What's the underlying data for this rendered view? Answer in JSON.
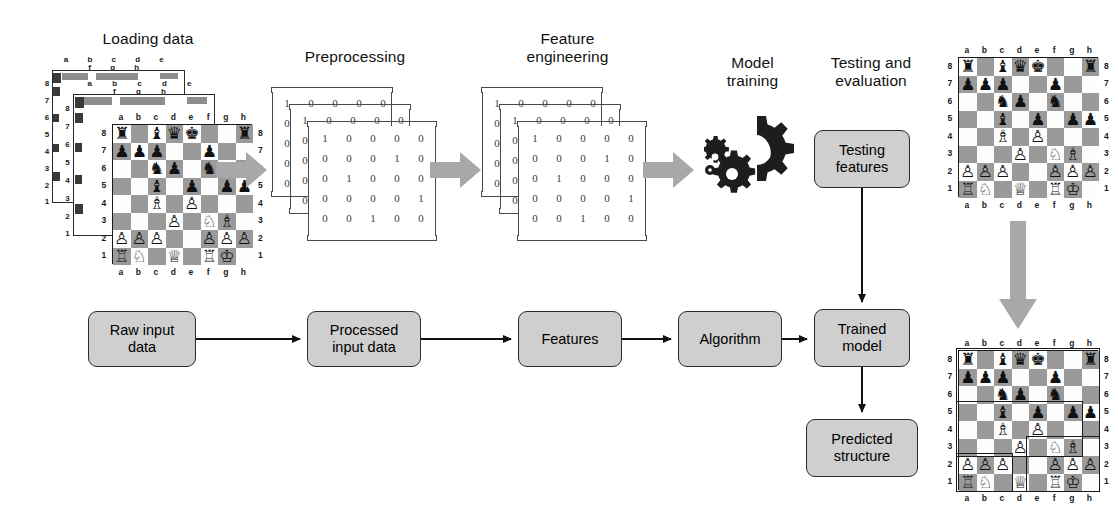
{
  "diagram": {
    "accent_gray": "#cfcfcf",
    "arrow_gray": "#a8a8a8",
    "line_color": "#1a1a1a"
  },
  "stage_labels": [
    {
      "id": "loading-data",
      "text": "Loading data"
    },
    {
      "id": "preprocessing",
      "text": "Preprocessing"
    },
    {
      "id": "feature-engineering",
      "text": "Feature\nengineering"
    },
    {
      "id": "model-training",
      "text": "Model\ntraining"
    },
    {
      "id": "testing-evaluation",
      "text": "Testing and\nevaluation"
    }
  ],
  "boxes": [
    {
      "id": "raw-input-data",
      "label": "Raw input\ndata"
    },
    {
      "id": "processed-input-data",
      "label": "Processed\ninput data"
    },
    {
      "id": "features",
      "label": "Features"
    },
    {
      "id": "algorithm",
      "label": "Algorithm"
    },
    {
      "id": "trained-model",
      "label": "Trained\nmodel"
    },
    {
      "id": "testing-features",
      "label": "Testing\nfeatures"
    },
    {
      "id": "predicted-structure",
      "label": "Predicted\nstructure"
    }
  ],
  "matrices": {
    "preprocessing": {
      "rows": 5,
      "cols": 5,
      "values": [
        [
          1,
          0,
          0,
          0,
          0
        ],
        [
          0,
          0,
          0,
          1,
          0
        ],
        [
          0,
          1,
          0,
          0,
          0
        ],
        [
          0,
          0,
          0,
          0,
          1
        ],
        [
          0,
          0,
          1,
          0,
          0
        ]
      ],
      "stack_behind": [
        {
          "first_col": [
            1,
            0,
            0,
            0,
            0
          ],
          "top_row": [
            1,
            0,
            0,
            0,
            0
          ]
        },
        {
          "first_col": [
            1,
            0,
            0,
            0,
            0
          ],
          "top_row": [
            1,
            0,
            0,
            0,
            0
          ]
        }
      ]
    },
    "feature_engineering": {
      "rows": 5,
      "cols": 5,
      "values": [
        [
          1,
          0,
          0,
          0,
          0
        ],
        [
          0,
          0,
          0,
          1,
          0
        ],
        [
          0,
          1,
          0,
          0,
          0
        ],
        [
          0,
          0,
          0,
          0,
          1
        ],
        [
          0,
          0,
          1,
          0,
          0
        ]
      ],
      "stack_behind": [
        {
          "first_col": [
            1,
            0,
            0,
            0,
            0
          ],
          "top_row": [
            1,
            0,
            0,
            0,
            0
          ]
        },
        {
          "first_col": [
            1,
            0,
            0,
            0,
            0
          ],
          "top_row": [
            1,
            0,
            0,
            0,
            0
          ]
        }
      ]
    }
  },
  "chess": {
    "files": [
      "a",
      "b",
      "c",
      "d",
      "e",
      "f",
      "g",
      "h"
    ],
    "ranks": [
      "8",
      "7",
      "6",
      "5",
      "4",
      "3",
      "2",
      "1"
    ],
    "position_name": "Main board position",
    "pieces": [
      {
        "sq": "a8",
        "piece": "rook",
        "color": "black",
        "glyph": "♜"
      },
      {
        "sq": "c8",
        "piece": "bishop",
        "color": "black",
        "glyph": "♝"
      },
      {
        "sq": "d8",
        "piece": "queen",
        "color": "black",
        "glyph": "♛"
      },
      {
        "sq": "e8",
        "piece": "king",
        "color": "black",
        "glyph": "♚"
      },
      {
        "sq": "h8",
        "piece": "rook",
        "color": "black",
        "glyph": "♜"
      },
      {
        "sq": "a7",
        "piece": "pawn",
        "color": "black",
        "glyph": "♟"
      },
      {
        "sq": "b7",
        "piece": "pawn",
        "color": "black",
        "glyph": "♟"
      },
      {
        "sq": "c7",
        "piece": "pawn",
        "color": "black",
        "glyph": "♟"
      },
      {
        "sq": "f7",
        "piece": "pawn",
        "color": "black",
        "glyph": "♟"
      },
      {
        "sq": "c6",
        "piece": "knight",
        "color": "black",
        "glyph": "♞"
      },
      {
        "sq": "d6",
        "piece": "pawn",
        "color": "black",
        "glyph": "♟"
      },
      {
        "sq": "f6",
        "piece": "knight",
        "color": "black",
        "glyph": "♞"
      },
      {
        "sq": "c5",
        "piece": "bishop",
        "color": "black",
        "glyph": "♝"
      },
      {
        "sq": "e5",
        "piece": "pawn",
        "color": "black",
        "glyph": "♟"
      },
      {
        "sq": "g5",
        "piece": "pawn",
        "color": "black",
        "glyph": "♟"
      },
      {
        "sq": "h5",
        "piece": "pawn",
        "color": "black",
        "glyph": "♟"
      },
      {
        "sq": "c4",
        "piece": "bishop",
        "color": "white",
        "glyph": "♗"
      },
      {
        "sq": "e4",
        "piece": "pawn",
        "color": "white",
        "glyph": "♙"
      },
      {
        "sq": "d3",
        "piece": "pawn",
        "color": "white",
        "glyph": "♙"
      },
      {
        "sq": "f3",
        "piece": "knight",
        "color": "white",
        "glyph": "♘"
      },
      {
        "sq": "g3",
        "piece": "bishop",
        "color": "white",
        "glyph": "♗"
      },
      {
        "sq": "a2",
        "piece": "pawn",
        "color": "white",
        "glyph": "♙"
      },
      {
        "sq": "b2",
        "piece": "pawn",
        "color": "white",
        "glyph": "♙"
      },
      {
        "sq": "c2",
        "piece": "pawn",
        "color": "white",
        "glyph": "♙"
      },
      {
        "sq": "f2",
        "piece": "pawn",
        "color": "white",
        "glyph": "♙"
      },
      {
        "sq": "g2",
        "piece": "pawn",
        "color": "white",
        "glyph": "♙"
      },
      {
        "sq": "h2",
        "piece": "pawn",
        "color": "white",
        "glyph": "♙"
      },
      {
        "sq": "a1",
        "piece": "rook",
        "color": "white",
        "glyph": "♖"
      },
      {
        "sq": "b1",
        "piece": "knight",
        "color": "white",
        "glyph": "♘"
      },
      {
        "sq": "d1",
        "piece": "queen",
        "color": "white",
        "glyph": "♕"
      },
      {
        "sq": "f1",
        "piece": "rook",
        "color": "white",
        "glyph": "♖"
      },
      {
        "sq": "g1",
        "piece": "king",
        "color": "white",
        "glyph": "♔"
      }
    ],
    "predicted_regions": [
      {
        "id": "region-outer",
        "from": "a8",
        "to": "h1"
      },
      {
        "id": "region-queenside",
        "from": "a2",
        "to": "c1"
      },
      {
        "id": "region-kingside",
        "from": "e3",
        "to": "h1"
      },
      {
        "id": "region-center",
        "from": "a5",
        "to": "g3"
      }
    ],
    "stack_count": 3
  },
  "icons": {
    "gears": "gears-icon",
    "block_arrow_right": "block-arrow-right-icon",
    "block_arrow_down": "block-arrow-down-icon"
  }
}
